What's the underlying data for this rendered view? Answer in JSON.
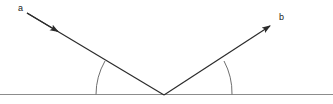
{
  "figure": {
    "type": "geometry-diagram",
    "background_color": "#ffffff",
    "width": 333,
    "height": 104
  },
  "labels": {
    "incident_ray": "a",
    "reflected_ray": "b"
  },
  "colors": {
    "ray_stroke": "#2b2b2b",
    "baseline_stroke": "#8c8c8c",
    "arc_stroke": "#6e6e6e",
    "label_text": "#1a1a1a"
  },
  "geometry": {
    "vertex": {
      "x": 164,
      "y": 95
    },
    "baseline": {
      "x1": 0,
      "y1": 94.5,
      "x2": 333,
      "y2": 94.5
    },
    "incident_ray": {
      "label": "a",
      "start": {
        "x": 27,
        "y": 13
      },
      "end": {
        "x": 164,
        "y": 95
      },
      "arrow_tip": {
        "x": 62,
        "y": 34
      },
      "direction": "down-right"
    },
    "reflected_ray": {
      "label": "b",
      "start": {
        "x": 164,
        "y": 95
      },
      "end": {
        "x": 273,
        "y": 24
      },
      "arrow_tip": {
        "x": 273,
        "y": 24
      },
      "direction": "up-right"
    },
    "angle_arc_left": {
      "radius": 68,
      "from": {
        "x": 96,
        "y": 94.5
      },
      "to": {
        "x": 105,
        "y": 61
      }
    },
    "angle_arc_right": {
      "radius": 68,
      "from": {
        "x": 224,
        "y": 61
      },
      "to": {
        "x": 232,
        "y": 94.5
      }
    }
  }
}
